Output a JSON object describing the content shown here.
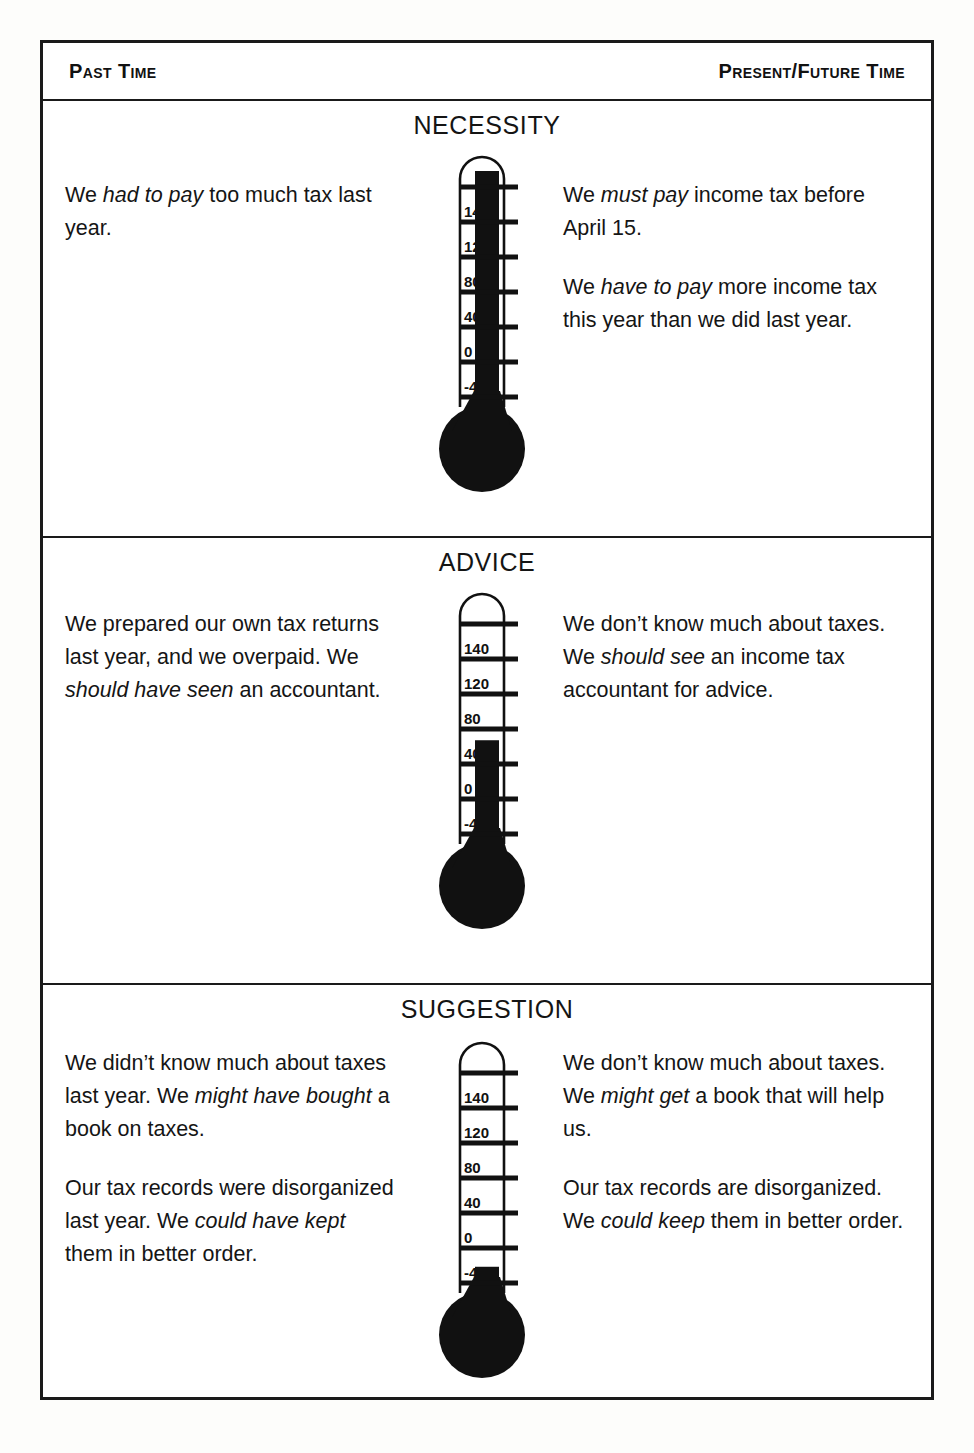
{
  "header": {
    "left_label": "Past Time",
    "right_label": "Present/Future Time"
  },
  "colors": {
    "ink": "#141414",
    "frame": "#1a1a1a",
    "mercury": "#111111",
    "page": "#ffffff"
  },
  "thermometer_scale": {
    "labels": [
      "140",
      "120",
      "80",
      "40",
      "0",
      "-40"
    ],
    "tick_count": 7
  },
  "sections": [
    {
      "title": "NECESSITY",
      "thermometer": {
        "level_label": "full",
        "fill_top_label": "above 140",
        "fill_percent": 100
      },
      "left": [
        [
          {
            "t": "We ",
            "i": false
          },
          {
            "t": "had to pay",
            "i": true
          },
          {
            "t": " too much tax last year.",
            "i": false
          }
        ]
      ],
      "right": [
        [
          {
            "t": "We ",
            "i": false
          },
          {
            "t": "must pay",
            "i": true
          },
          {
            "t": " income tax before April 15.",
            "i": false
          }
        ],
        [
          {
            "t": "We ",
            "i": false
          },
          {
            "t": "have to pay",
            "i": true
          },
          {
            "t": " more income tax this year than we did last year.",
            "i": false
          }
        ]
      ]
    },
    {
      "title": "ADVICE",
      "thermometer": {
        "level_label": "middle",
        "fill_top_label": "between 40 and 80",
        "fill_percent": 42
      },
      "left": [
        [
          {
            "t": "We prepared our own tax returns last year, and we overpaid. We ",
            "i": false
          },
          {
            "t": "should have seen",
            "i": true
          },
          {
            "t": " an accountant.",
            "i": false
          }
        ]
      ],
      "right": [
        [
          {
            "t": "We don’t know much about taxes. We ",
            "i": false
          },
          {
            "t": "should see",
            "i": true
          },
          {
            "t": " an income tax accountant for advice.",
            "i": false
          }
        ]
      ]
    },
    {
      "title": "SUGGESTION",
      "thermometer": {
        "level_label": "low",
        "fill_top_label": "at -40",
        "fill_percent": 8
      },
      "left": [
        [
          {
            "t": "We didn’t know much about taxes last year. We ",
            "i": false
          },
          {
            "t": "might have bought",
            "i": true
          },
          {
            "t": " a book on taxes.",
            "i": false
          }
        ],
        [
          {
            "t": "Our tax records were disorganized last year. We ",
            "i": false
          },
          {
            "t": "could have kept",
            "i": true
          },
          {
            "t": " them in better order.",
            "i": false
          }
        ]
      ],
      "right": [
        [
          {
            "t": "We don’t know much about taxes. We ",
            "i": false
          },
          {
            "t": "might get",
            "i": true
          },
          {
            "t": " a book that will help us.",
            "i": false
          }
        ],
        [
          {
            "t": "Our tax records are disorganized. We ",
            "i": false
          },
          {
            "t": "could keep",
            "i": true
          },
          {
            "t": " them in better order.",
            "i": false
          }
        ]
      ]
    }
  ]
}
